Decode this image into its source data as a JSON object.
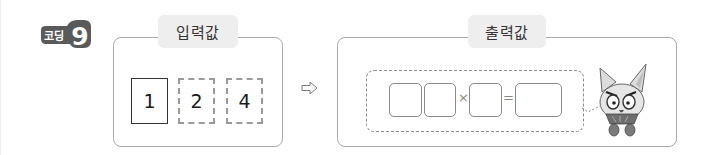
{
  "badge": {
    "label": "코딩",
    "number": "9",
    "color": "#5a5a5a"
  },
  "input_panel": {
    "title": "입력값",
    "cards": [
      {
        "value": "1",
        "border": "solid"
      },
      {
        "value": "2",
        "border": "dashed"
      },
      {
        "value": "4",
        "border": "dashed"
      }
    ]
  },
  "arrow": {
    "glyph": "⇨",
    "icon": "right-arrow-icon"
  },
  "output_panel": {
    "title": "출력값",
    "expression": {
      "boxes": [
        "",
        "",
        "",
        ""
      ],
      "operators": [
        "×",
        "="
      ]
    },
    "mascot": "fox-robot-mascot"
  },
  "colors": {
    "panel_border": "#a9a9a9",
    "title_tab_bg": "#eeeeee",
    "badge_bg": "#5a5a5a",
    "dashed_border": "#9a9a9a"
  }
}
